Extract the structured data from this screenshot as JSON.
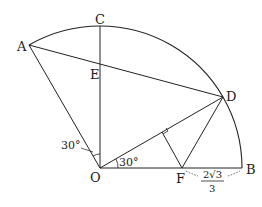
{
  "diagram": {
    "type": "geometry",
    "points": {
      "A": {
        "label": "A"
      },
      "B": {
        "label": "B"
      },
      "C": {
        "label": "C"
      },
      "D": {
        "label": "D"
      },
      "E": {
        "label": "E"
      },
      "F": {
        "label": "F"
      },
      "O": {
        "label": "O"
      }
    },
    "angles": {
      "AOC": "30°",
      "DOB": "30°"
    },
    "lengths": {
      "FB_numerator": "2√3",
      "FB_denominator": "3"
    },
    "segments": [
      "OA",
      "OC",
      "OB",
      "OD",
      "AD",
      "DF",
      "F-foot on OD",
      "arc AB"
    ],
    "marks": [
      "right angle at foot of perpendicular from F to OD"
    ],
    "colors": {
      "stroke": "#222222",
      "background": "#ffffff"
    }
  }
}
